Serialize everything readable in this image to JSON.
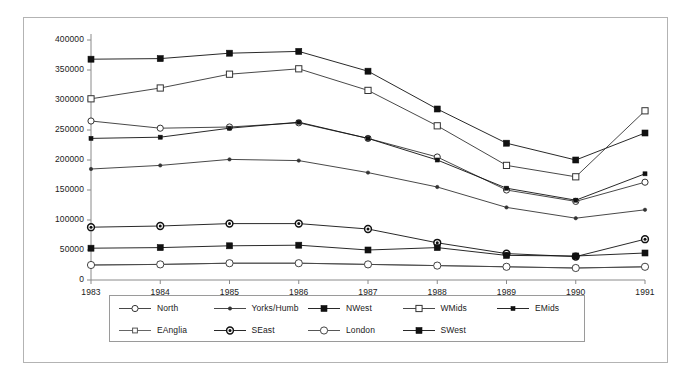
{
  "chart_data": {
    "type": "line",
    "title": "",
    "subtitle": "",
    "xlabel": "",
    "ylabel": "",
    "x": [
      1983,
      1984,
      1985,
      1986,
      1987,
      1988,
      1989,
      1990,
      1991
    ],
    "xtick_labels": [
      "1983",
      "1984",
      "1985",
      "1986",
      "1987",
      "1988",
      "1989",
      "1990",
      "1991"
    ],
    "ytick_labels": [
      "0",
      "50000",
      "100000",
      "150000",
      "200000",
      "250000",
      "300000",
      "350000",
      "400000"
    ],
    "yticks": [
      0,
      50000,
      100000,
      150000,
      200000,
      250000,
      300000,
      350000,
      400000
    ],
    "xlim": [
      1983,
      1991
    ],
    "ylim": [
      0,
      400000
    ],
    "grid": false,
    "legend_position": "bottom",
    "series": [
      {
        "name": "North",
        "marker": "open-circle",
        "color": "#333333",
        "values": [
          265000,
          253000,
          255000,
          262000,
          236000,
          205000,
          150000,
          131000,
          163000
        ]
      },
      {
        "name": "Yorks/Humb",
        "marker": "small-dot",
        "color": "#333333",
        "values": [
          185000,
          191000,
          201000,
          199000,
          179000,
          155000,
          121000,
          103000,
          117000
        ]
      },
      {
        "name": "NWest",
        "marker": "filled-square",
        "color": "#111111",
        "values": [
          368000,
          369000,
          378000,
          381000,
          348000,
          285000,
          228000,
          200000,
          245000
        ]
      },
      {
        "name": "WMids",
        "marker": "open-square",
        "color": "#333333",
        "values": [
          302000,
          320000,
          343000,
          352000,
          316000,
          257000,
          191000,
          172000,
          282000
        ]
      },
      {
        "name": "EMids",
        "marker": "small-filled-square",
        "color": "#111111",
        "values": [
          236000,
          238000,
          253000,
          263000,
          236000,
          200000,
          153000,
          133000,
          177000
        ]
      },
      {
        "name": "EAnglia",
        "marker": "small-open-square",
        "color": "#555555",
        "values": [
          25000,
          26000,
          28000,
          28000,
          26000,
          24000,
          22000,
          20000,
          22000
        ]
      },
      {
        "name": "SEast",
        "marker": "bullseye",
        "color": "#111111",
        "values": [
          88000,
          90000,
          94000,
          94000,
          85000,
          62000,
          44000,
          39000,
          68000
        ]
      },
      {
        "name": "London",
        "marker": "large-open-circle",
        "color": "#444444",
        "values": [
          25000,
          26000,
          28000,
          28000,
          26000,
          24000,
          22000,
          20000,
          22000
        ]
      },
      {
        "name": "SWest",
        "marker": "filled-square",
        "color": "#111111",
        "values": [
          53000,
          54000,
          57000,
          58000,
          50000,
          54000,
          41000,
          40000,
          45000
        ]
      }
    ]
  },
  "legend": {
    "row1": [
      "North",
      "Yorks/Humb",
      "NWest",
      "WMids",
      "EMids"
    ],
    "row2": [
      "EAnglia",
      "SEast",
      "London",
      "SWest"
    ]
  }
}
